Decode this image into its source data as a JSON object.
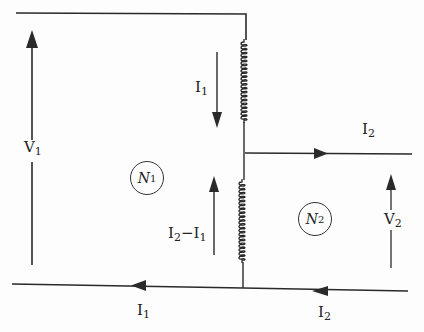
{
  "diagram": {
    "type": "circuit",
    "colors": {
      "line": "#2a2a2a",
      "background": "#fdfdfd"
    },
    "nodes": [
      {
        "id": "N1",
        "label": "N",
        "sub": "1"
      },
      {
        "id": "N2",
        "label": "N",
        "sub": "2"
      }
    ],
    "labels": {
      "v1": {
        "main": "V",
        "sub": "1"
      },
      "v2": {
        "main": "V",
        "sub": "2"
      },
      "i1_coil": {
        "main": "I",
        "sub": "1"
      },
      "i2_out": {
        "main": "I",
        "sub": "2"
      },
      "i2_minus_i1": {
        "main": "I",
        "sub": "2",
        "sep": "−",
        "main2": "I",
        "sub2": "1"
      },
      "i1_bottom": {
        "main": "I",
        "sub": "1"
      },
      "i2_bottom": {
        "main": "I",
        "sub": "2"
      }
    },
    "components": [
      {
        "id": "coil-upper",
        "type": "inductor"
      },
      {
        "id": "coil-lower",
        "type": "inductor"
      }
    ],
    "arrows": [
      {
        "id": "V1",
        "direction": "up"
      },
      {
        "id": "I1-coil",
        "direction": "down"
      },
      {
        "id": "I2-minus-I1",
        "direction": "up"
      },
      {
        "id": "I2-out",
        "direction": "right"
      },
      {
        "id": "V2",
        "direction": "up"
      },
      {
        "id": "I1-bottom",
        "direction": "left"
      },
      {
        "id": "I2-bottom",
        "direction": "left"
      }
    ]
  }
}
